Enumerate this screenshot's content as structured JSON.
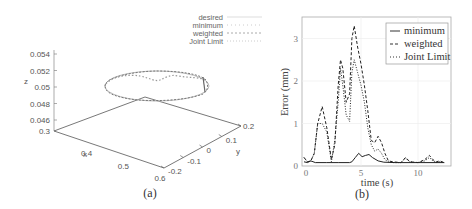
{
  "chart_data": [
    {
      "id": "a",
      "type": "line3d",
      "caption": "(a)",
      "title": "",
      "xlabel": "x",
      "ylabel": "y",
      "zlabel": "z",
      "x_ticks": [
        "0.3",
        "0.4",
        "0.5",
        "0.6"
      ],
      "y_ticks": [
        "-0.2",
        "-0.1",
        "0",
        "0.1",
        "0.2"
      ],
      "z_ticks": [
        "0.046",
        "0.048",
        "0.05",
        "0.052",
        "0.054"
      ],
      "xlim": [
        0.3,
        0.6
      ],
      "ylim": [
        -0.2,
        0.2
      ],
      "zlim": [
        0.046,
        0.054
      ],
      "legend": [
        "desired",
        "minimum",
        "weighted",
        "Joint Limit"
      ],
      "legend_position": "top-right",
      "description": "Circular trajectory at z ≈ 0.05 traced by desired, minimum, weighted and Joint Limit controllers; curves overlap closely with small wobble on the far side."
    },
    {
      "id": "b",
      "type": "line",
      "caption": "(b)",
      "title": "",
      "xlabel": "time (s)",
      "ylabel": "Error (mm)",
      "xlim": [
        0,
        12.8
      ],
      "ylim": [
        0,
        3.4
      ],
      "x_ticks": [
        "0",
        "5",
        "10"
      ],
      "y_ticks": [
        "0",
        "1",
        "2",
        "3"
      ],
      "grid": true,
      "legend_position": "top-right",
      "series": [
        {
          "name": "minimum",
          "style": "solid",
          "x": [
            0,
            0.3,
            0.6,
            1,
            2,
            3,
            4,
            4.2,
            4.5,
            4.8,
            5.1,
            5.4,
            5.7,
            6.0,
            6.5,
            7,
            8,
            10,
            12.3
          ],
          "y": [
            0.1,
            0.08,
            0.12,
            0.08,
            0.08,
            0.08,
            0.08,
            0.1,
            0.2,
            0.3,
            0.22,
            0.25,
            0.27,
            0.2,
            0.12,
            0.09,
            0.08,
            0.08,
            0.08
          ]
        },
        {
          "name": "weighted",
          "style": "dashed",
          "x": [
            0,
            0.3,
            0.6,
            0.9,
            1.2,
            1.6,
            2.0,
            2.4,
            2.7,
            3.0,
            3.2,
            3.4,
            3.7,
            4.0,
            4.2,
            4.4,
            4.7,
            5.0,
            5.3,
            5.6,
            5.9,
            6.2,
            6.5,
            6.8,
            7.1,
            7.4,
            7.8,
            8.5,
            8.9,
            9.3,
            10,
            10.6,
            11.0,
            11.3,
            11.6,
            11.9,
            12.3
          ],
          "y": [
            0.2,
            0.1,
            0.12,
            0.3,
            1.0,
            1.4,
            0.9,
            0.15,
            0.5,
            1.9,
            2.5,
            2.3,
            1.5,
            1.7,
            3.0,
            3.3,
            2.8,
            2.4,
            1.9,
            1.3,
            0.6,
            0.55,
            0.7,
            0.55,
            0.3,
            0.12,
            0.1,
            0.08,
            0.2,
            0.1,
            0.08,
            0.15,
            0.25,
            0.15,
            0.1,
            0.12,
            0.08
          ]
        },
        {
          "name": "Joint Limit",
          "style": "dotted",
          "x": [
            0,
            0.3,
            0.6,
            0.9,
            1.2,
            1.6,
            2.0,
            2.4,
            2.7,
            3.0,
            3.2,
            3.4,
            3.7,
            4.0,
            4.2,
            4.4,
            4.7,
            5.0,
            5.3,
            5.6,
            5.9,
            6.2,
            6.5,
            6.8,
            7.1,
            7.4,
            7.8,
            8.5,
            8.9,
            9.3,
            10,
            10.6,
            11.0,
            11.3,
            11.6,
            11.9,
            12.3
          ],
          "y": [
            0.2,
            0.1,
            0.12,
            0.3,
            1.0,
            1.0,
            0.8,
            0.1,
            0.6,
            1.5,
            2.3,
            1.9,
            1.2,
            1.05,
            2.2,
            2.5,
            2.2,
            1.9,
            1.5,
            0.9,
            0.5,
            0.35,
            0.4,
            0.3,
            0.15,
            0.1,
            0.08,
            0.08,
            0.18,
            0.1,
            0.08,
            0.12,
            0.2,
            0.12,
            0.08,
            0.1,
            0.08
          ]
        }
      ]
    }
  ],
  "figure": {
    "caption_a": "(a)",
    "caption_b": "(b)"
  }
}
